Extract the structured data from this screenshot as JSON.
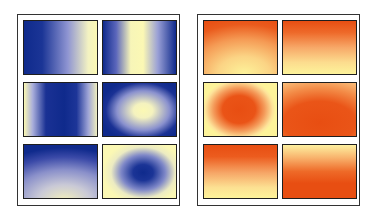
{
  "colors": {
    "blue": "#0f2a8c",
    "pale_yellow": "#fbf8b4",
    "orange": "#e84e12",
    "light_yellow": "#fdf39a",
    "border": "#1e1e1e"
  },
  "panels": [
    {
      "id": "blue",
      "tiles": [
        {
          "name": "linear-horizontal-blue-to-yellow",
          "gradient": "linear-gradient(90deg, #0f2a8c 0%, #1b3596 25%, #8f95d2 60%, #f3f2c2 88%, #fbf8b4 100%)"
        },
        {
          "name": "vertical-band-yellow-center",
          "gradient": "linear-gradient(90deg, #0f2a8c 0%, #5b66bb 18%, #f7f5b8 38%, #fbf8b4 55%, #9aa0d6 75%, #0f2a8c 100%)"
        },
        {
          "name": "vertical-band-blue-center",
          "gradient": "linear-gradient(90deg, #fbf8b4 0%, #a9aedb 12%, #1a3194 30%, #0f2a8c 55%, #1d3598 72%, #9ea4d6 88%, #eeedbf 100%)"
        },
        {
          "name": "radial-yellow-center",
          "gradient": "radial-gradient(ellipse 60% 62% at 55% 52%, #fbf8b4 0%, #f4f2bf 22%, #8a91ce 60%, #1a3194 85%, #0f2a8c 100%)"
        },
        {
          "name": "linear-vertical-blue-top-yellow-bottom",
          "gradient": "radial-gradient(ellipse 120% 100% at 55% 105%, #f2efbd 0%, #c9c9d6 30%, #8a90ca 58%, #3b4aa8 82%, #0f2a8c 100%)"
        },
        {
          "name": "radial-blue-center",
          "gradient": "radial-gradient(ellipse 55% 60% at 55% 52%, #0f2a8c 0%, #1b3496 25%, #7f88c8 55%, #ecebc2 80%, #fbf8b4 100%)"
        }
      ]
    },
    {
      "id": "orange",
      "tiles": [
        {
          "name": "linear-vertical-orange-top",
          "gradient": "radial-gradient(ellipse 120% 110% at 55% 100%, #fdf39a 0%, #fbd485 30%, #f59a54 60%, #ea5b1d 85%, #e84e12 100%)"
        },
        {
          "name": "linear-vertical-orange-top-2",
          "gradient": "linear-gradient(180deg, #e84e12 0%, #ee6a2a 22%, #f7a868 50%, #fcdc8e 78%, #fdf39a 100%)"
        },
        {
          "name": "radial-orange-center",
          "gradient": "radial-gradient(ellipse 50% 58% at 48% 50%, #e84e12 0%, #ea5417 45%, #f49a5a 70%, #fde39a 92%, #fdf39a 100%)"
        },
        {
          "name": "radial-orange-bottom",
          "gradient": "radial-gradient(ellipse 110% 90% at 50% 75%, #e84e12 0%, #ea5518 45%, #f38c48 72%, #fbc985 100%)"
        },
        {
          "name": "linear-vertical-orange-top-3",
          "gradient": "linear-gradient(180deg, #e84e12 0%, #ec5c1e 22%, #f6a566 52%, #fce092 80%, #fdf39a 100%)"
        },
        {
          "name": "linear-vertical-yellow-top",
          "gradient": "linear-gradient(180deg, #fdf0a0 0%, #f8b06a 25%, #ee6a28 50%, #e84e12 72%, #e84e12 100%)"
        }
      ]
    }
  ]
}
